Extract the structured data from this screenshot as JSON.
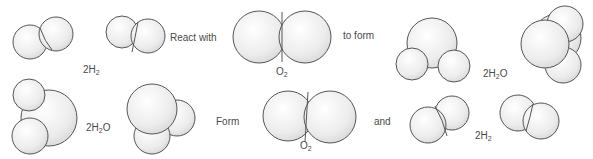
{
  "diagram": {
    "row1": {
      "reactant1_label": {
        "prefix": "2H",
        "sub": "2",
        "suffix": ""
      },
      "connector1": "React with",
      "reactant2_label": {
        "prefix": "O",
        "sub": "2",
        "suffix": ""
      },
      "connector2": "to form",
      "product_label": {
        "prefix": "2H",
        "sub": "2",
        "suffix": "O"
      }
    },
    "row2": {
      "reactant_label": {
        "prefix": "2H",
        "sub": "2",
        "suffix": "O"
      },
      "connector1": "Form",
      "product1_label": {
        "prefix": "O",
        "sub": "2",
        "suffix": ""
      },
      "connector2": "and",
      "product2_label": {
        "prefix": "2H",
        "sub": "2",
        "suffix": ""
      }
    },
    "colors": {
      "sphere_fill": "#f2f2f2",
      "sphere_stroke": "#555555",
      "text": "#4a4a4a"
    }
  }
}
